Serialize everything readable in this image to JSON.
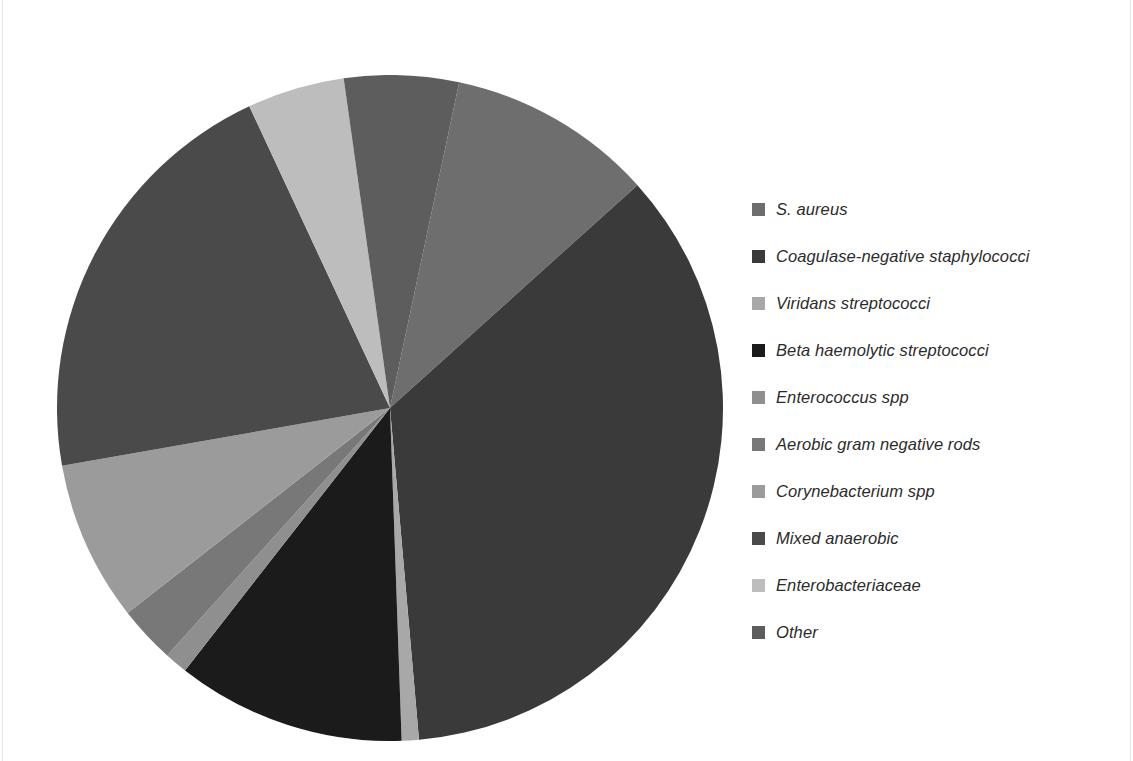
{
  "chart_data": {
    "type": "pie",
    "title": "",
    "legend_position": "right",
    "start_angle_deg": 12,
    "direction": "clockwise",
    "categories": [
      "S. aureus",
      "Coagulase-negative staphylococci",
      "Viridans streptococci",
      "Beta haemolytic streptococci",
      "Enterococcus spp",
      "Aerobic gram negative rods",
      "Corynebacterium spp",
      "Mixed anaerobic",
      "Enterobacteriaceae",
      "Other"
    ],
    "values": [
      10.0,
      35.3,
      0.8,
      11.1,
      1.1,
      2.8,
      7.8,
      20.8,
      4.7,
      5.6
    ],
    "units": "percent",
    "colors": [
      "#6e6e6e",
      "#3a3a3a",
      "#a8a8a8",
      "#1b1b1b",
      "#8f8f8f",
      "#787878",
      "#9b9b9b",
      "#4a4a4a",
      "#bdbdbd",
      "#5d5d5d"
    ],
    "slice_angles_deg": [
      [
        12,
        48
      ],
      [
        48,
        175
      ],
      [
        175,
        178
      ],
      [
        178,
        218
      ],
      [
        218,
        222
      ],
      [
        222,
        232
      ],
      [
        232,
        260
      ],
      [
        260,
        335
      ],
      [
        335,
        352
      ],
      [
        352,
        372
      ]
    ]
  },
  "legend": {
    "items": [
      {
        "label": "S. aureus",
        "color": "#6e6e6e"
      },
      {
        "label": "Coagulase-negative staphylococci",
        "color": "#3a3a3a"
      },
      {
        "label": "Viridans streptococci",
        "color": "#a8a8a8"
      },
      {
        "label": "Beta haemolytic streptococci",
        "color": "#1b1b1b"
      },
      {
        "label": "Enterococcus spp",
        "color": "#8f8f8f"
      },
      {
        "label": "Aerobic gram negative rods",
        "color": "#787878"
      },
      {
        "label": "Corynebacterium spp",
        "color": "#9b9b9b"
      },
      {
        "label": "Mixed anaerobic",
        "color": "#4a4a4a"
      },
      {
        "label": "Enterobacteriaceae",
        "color": "#bdbdbd"
      },
      {
        "label": "Other",
        "color": "#5d5d5d"
      }
    ]
  },
  "pie_geometry": {
    "cx": 333,
    "cy": 333,
    "r": 333
  }
}
